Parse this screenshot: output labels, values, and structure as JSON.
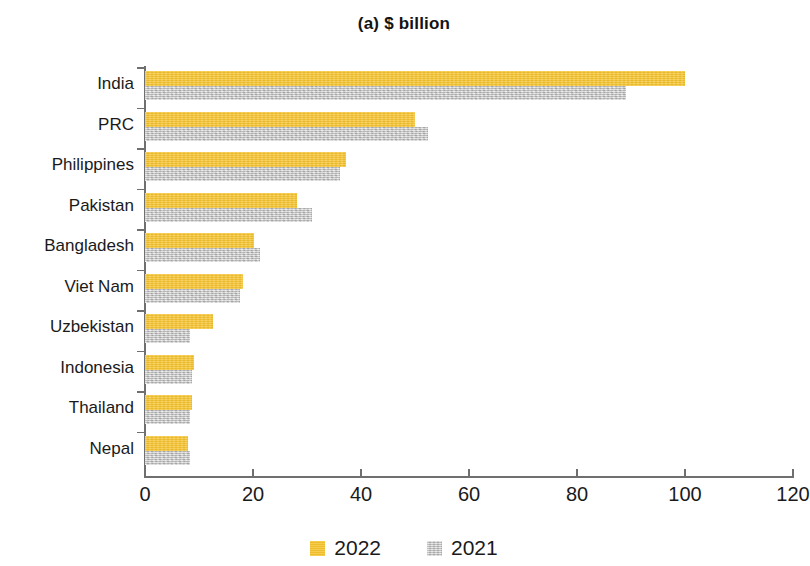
{
  "chart_data": {
    "type": "bar",
    "orientation": "horizontal",
    "title": "(a) $ billion",
    "xlabel": "",
    "ylabel": "",
    "xlim": [
      0,
      120
    ],
    "xticks": [
      0,
      20,
      40,
      60,
      80,
      100,
      120
    ],
    "xtick_labels": [
      "0",
      "20",
      "40",
      "60",
      "80",
      "100",
      "120"
    ],
    "grid": false,
    "legend_position": "bottom-center",
    "categories": [
      "India",
      "PRC",
      "Philippines",
      "Pakistan",
      "Bangladesh",
      "Viet Nam",
      "Uzbekistan",
      "Indonesia",
      "Thailand",
      "Nepal"
    ],
    "series": [
      {
        "name": "2022",
        "color": "#f5c32e",
        "values": [
          100.0,
          50.0,
          37.2,
          28.2,
          20.1,
          18.2,
          12.6,
          9.0,
          8.7,
          7.9
        ]
      },
      {
        "name": "2021",
        "color": "#c9c9c9",
        "values": [
          89.0,
          52.4,
          36.1,
          31.0,
          21.3,
          17.6,
          8.3,
          8.7,
          8.3,
          8.3
        ]
      }
    ]
  },
  "legend": {
    "items": [
      {
        "label": "2022",
        "swatch_class": "sw-2022"
      },
      {
        "label": "2021",
        "swatch_class": "sw-2021"
      }
    ]
  },
  "axis": {
    "line_color": "#6f6f6f"
  }
}
